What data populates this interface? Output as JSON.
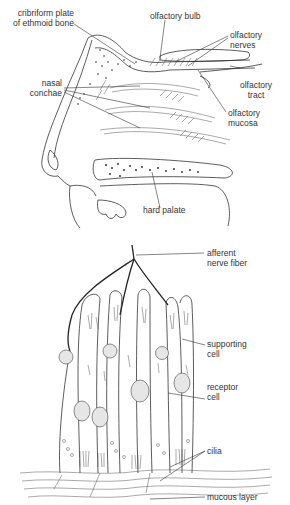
{
  "top_figure": {
    "title": "Sagittal section of nasal cavity",
    "labels": {
      "cribriform": [
        "cribriform plate",
        "of ethmoid bone"
      ],
      "olfactory_bulb": "olfactory bulb",
      "olfactory_nerves": [
        "olfactory",
        "nerves"
      ],
      "nasal_conchae": [
        "nasal",
        "conchae"
      ],
      "olfactory_tract": [
        "olfactory",
        "tract"
      ],
      "olfactory_mucosa": [
        "olfactory",
        "mucosa"
      ],
      "hard_palate": "hard palate"
    }
  },
  "bottom_figure": {
    "title": "Olfactory epithelium",
    "labels": {
      "afferent_nerve_fiber": [
        "afferent",
        "nerve fiber"
      ],
      "supporting_cell": [
        "supporting",
        "cell"
      ],
      "receptor_cell": [
        "receptor",
        "cell"
      ],
      "cilia": "cilia",
      "mucous_layer": "mucous layer"
    }
  }
}
